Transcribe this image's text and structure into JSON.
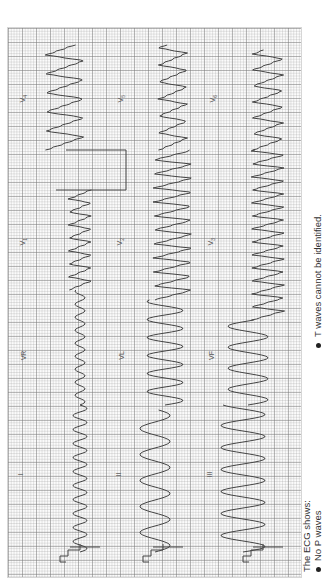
{
  "figure": {
    "orientation": "rotated-90-ccw",
    "grid": {
      "minor_color": "#c8c8c8",
      "major_color": "#9a9a9a",
      "paper_color": "#fbfbfb"
    },
    "trace_color": "#444444",
    "leads": [
      {
        "id": "I",
        "label": "I",
        "x": 24,
        "y": 475
      },
      {
        "id": "II",
        "label": "II",
        "x": 121,
        "y": 475
      },
      {
        "id": "III",
        "label": "III",
        "x": 211,
        "y": 475
      },
      {
        "id": "VR",
        "label": "VR",
        "x": 23,
        "y": 356
      },
      {
        "id": "VL",
        "label": "VL",
        "x": 121,
        "y": 356
      },
      {
        "id": "VF",
        "label": "VF",
        "x": 211,
        "y": 356
      },
      {
        "id": "V1",
        "label": "V",
        "sub": "1",
        "x": 24,
        "y": 241
      },
      {
        "id": "V2",
        "label": "V",
        "sub": "2",
        "x": 121,
        "y": 241
      },
      {
        "id": "V3",
        "label": "V",
        "sub": "3",
        "x": 212,
        "y": 241
      },
      {
        "id": "V4",
        "label": "V",
        "sub": "4",
        "x": 24,
        "y": 98
      },
      {
        "id": "V5",
        "label": "V",
        "sub": "5",
        "x": 122,
        "y": 98
      },
      {
        "id": "V6",
        "label": "V",
        "sub": "6",
        "x": 214,
        "y": 98
      }
    ],
    "traces": [
      {
        "name": "row1-I-VR-V1-V4",
        "baseline_x": 80,
        "segments": [
          {
            "y0": 552,
            "y1": 405,
            "amp": 7,
            "period": 14,
            "shape": "sine"
          },
          {
            "y0": 405,
            "y1": 290,
            "amp": 5,
            "period": 13,
            "shape": "sine"
          },
          {
            "y0": 290,
            "y1": 190,
            "amp": 11,
            "period": 13,
            "shape": "saw"
          },
          {
            "y0": 150,
            "y1": 45,
            "amp": 19,
            "period": 19,
            "shape": "saw",
            "offset": -15
          }
        ],
        "cal_step": {
          "y": 190,
          "x_from": 56,
          "x_to": 126,
          "y_to": 150
        }
      },
      {
        "name": "row2-II-VL-V2-V5",
        "baseline_x": 155,
        "segments": [
          {
            "y0": 552,
            "y1": 410,
            "amp": 15,
            "period": 26,
            "shape": "sine"
          },
          {
            "y0": 405,
            "y1": 300,
            "amp": 18,
            "period": 18,
            "shape": "sine",
            "offset": 10
          },
          {
            "y0": 300,
            "y1": 150,
            "amp": 19,
            "period": 14,
            "shape": "saw",
            "offset": 18
          },
          {
            "y0": 150,
            "y1": 45,
            "amp": 14,
            "period": 17,
            "shape": "saw",
            "offset": 18
          }
        ]
      },
      {
        "name": "row3-III-VF-V3-V6",
        "baseline_x": 243,
        "segments": [
          {
            "y0": 552,
            "y1": 405,
            "amp": 22,
            "period": 22,
            "shape": "sine"
          },
          {
            "y0": 405,
            "y1": 320,
            "amp": 20,
            "period": 21,
            "shape": "sine",
            "offset": 5
          },
          {
            "y0": 320,
            "y1": 150,
            "amp": 16,
            "period": 13,
            "shape": "saw",
            "offset": 25
          },
          {
            "y0": 150,
            "y1": 50,
            "amp": 15,
            "period": 16,
            "shape": "saw",
            "offset": 25
          }
        ]
      }
    ],
    "calibration_pulses": [
      {
        "x": 60,
        "y": 550
      },
      {
        "x": 143,
        "y": 550
      },
      {
        "x": 243,
        "y": 550
      }
    ]
  },
  "caption": {
    "heading": "The ECG shows:",
    "bullets": [
      "No P waves",
      "T waves cannot be identified."
    ]
  }
}
